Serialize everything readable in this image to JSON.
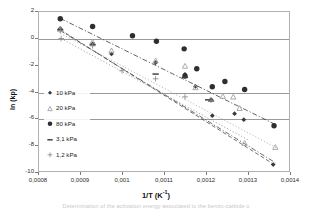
{
  "figure": {
    "caption": "Determination of the activation energy associated to the benzo-carbide o"
  },
  "chart_data": {
    "type": "scatter",
    "title": "",
    "xlabel": "1/T (K-1)",
    "xlabel_base": "1/T (K",
    "xlabel_sup": "-1",
    "xlabel_tail": ")",
    "ylabel": "ln (kp)",
    "xlim": [
      0.0008,
      0.0014
    ],
    "ylim": [
      -10,
      2
    ],
    "xticks": [
      0.0008,
      0.0009,
      0.001,
      0.0011,
      0.0012,
      0.0013,
      0.0014
    ],
    "xtick_labels": [
      "0,0008",
      "0,0009",
      "0,001",
      "0,0011",
      "0,0012",
      "0,0013",
      "0,0014"
    ],
    "yticks": [
      2,
      0,
      -2,
      -4,
      -6,
      -8,
      -10
    ],
    "ytick_labels": [
      "2",
      "0",
      "-2",
      "-4",
      "-6",
      "-8",
      "-10"
    ],
    "gridlines_y": [
      0,
      -4,
      -6
    ],
    "grid": "horizontal-partial",
    "legend_position": "inner-lower-left",
    "series": [
      {
        "name": "10 kPa",
        "marker": "diamond",
        "color": "#3a3a3a",
        "trendline": "dash-dot",
        "points": [
          {
            "x": 0.000853,
            "y": 0.7
          },
          {
            "x": 0.00093,
            "y": -0.45
          },
          {
            "x": 0.000975,
            "y": -1.2
          },
          {
            "x": 0.00108,
            "y": -1.85
          },
          {
            "x": 0.00115,
            "y": -2.72
          },
          {
            "x": 0.001175,
            "y": -3.62
          },
          {
            "x": 0.001212,
            "y": -4.6
          },
          {
            "x": 0.001215,
            "y": -5.8
          },
          {
            "x": 0.001268,
            "y": -5.65
          },
          {
            "x": 0.00129,
            "y": -6.1
          },
          {
            "x": 0.00136,
            "y": -9.45
          }
        ],
        "fit": {
          "x1": 0.000853,
          "y1": 0.55,
          "x2": 0.001365,
          "y2": -9.3
        }
      },
      {
        "name": "20 kPa",
        "marker": "triangle",
        "color": "#a0a0a0",
        "trendline": "dotted",
        "points": [
          {
            "x": 0.000853,
            "y": 0.62
          },
          {
            "x": 0.00093,
            "y": -0.3
          },
          {
            "x": 0.000975,
            "y": -0.95
          },
          {
            "x": 0.00108,
            "y": -1.7
          },
          {
            "x": 0.00115,
            "y": -2.1
          },
          {
            "x": 0.001175,
            "y": -3.7
          },
          {
            "x": 0.00124,
            "y": -4.35
          },
          {
            "x": 0.001265,
            "y": -4.4
          },
          {
            "x": 0.00128,
            "y": -5.25
          },
          {
            "x": 0.001292,
            "y": -7.85
          },
          {
            "x": 0.001365,
            "y": -8.15
          }
        ],
        "fit": {
          "x1": 0.000853,
          "y1": 0.35,
          "x2": 0.001368,
          "y2": -8.2
        }
      },
      {
        "name": "80 kPa",
        "marker": "circle",
        "color": "#2e2e2e",
        "trendline": "dash-dot",
        "points": [
          {
            "x": 0.000853,
            "y": 1.42
          },
          {
            "x": 0.00093,
            "y": 0.85
          },
          {
            "x": 0.001025,
            "y": 0.15
          },
          {
            "x": 0.001082,
            "y": -0.25
          },
          {
            "x": 0.001148,
            "y": -0.82
          },
          {
            "x": 0.00115,
            "y": -2.85
          },
          {
            "x": 0.001178,
            "y": -2.3
          },
          {
            "x": 0.001215,
            "y": -3.65
          },
          {
            "x": 0.001245,
            "y": -3.25
          },
          {
            "x": 0.001292,
            "y": -3.85
          },
          {
            "x": 0.001362,
            "y": -6.55
          }
        ],
        "fit": {
          "x1": 0.000853,
          "y1": 1.45,
          "x2": 0.001368,
          "y2": -6.5
        }
      },
      {
        "name": "3,1 kPa",
        "marker": "dash",
        "color": "#404040",
        "trendline": "dashed",
        "points": [
          {
            "x": 0.000853,
            "y": 0.6
          },
          {
            "x": 0.00093,
            "y": -0.52
          },
          {
            "x": 0.00108,
            "y": -2.7
          },
          {
            "x": 0.00115,
            "y": -2.95
          },
          {
            "x": 0.001205,
            "y": -4.62
          },
          {
            "x": 0.001212,
            "y": -4.7
          }
        ],
        "fit": {
          "x1": 0.000853,
          "y1": 0.6,
          "x2": 0.00136,
          "y2": -9.4
        }
      },
      {
        "name": "1,2 kPa",
        "marker": "plus",
        "color": "#8a8a8a",
        "trendline": "dotted",
        "points": [
          {
            "x": 0.000853,
            "y": 0.55
          },
          {
            "x": 0.000855,
            "y": -0.05
          },
          {
            "x": 0.00093,
            "y": -0.6
          },
          {
            "x": 0.001,
            "y": -2.45
          },
          {
            "x": 0.00108,
            "y": -3.05
          },
          {
            "x": 0.00115,
            "y": -4.4
          },
          {
            "x": 0.001212,
            "y": -4.65
          }
        ],
        "fit": {
          "x1": 0.000855,
          "y1": -0.05,
          "x2": 0.0013,
          "y2": -7.6
        }
      }
    ]
  },
  "legend": {
    "entries": [
      {
        "label": "10 kPa",
        "marker": "diamond"
      },
      {
        "label": "20 kPa",
        "marker": "triangle"
      },
      {
        "label": "80 kPa",
        "marker": "circle"
      },
      {
        "label": "3,1 kPa",
        "marker": "dash"
      },
      {
        "label": "1,2 kPa",
        "marker": "plus"
      }
    ]
  }
}
